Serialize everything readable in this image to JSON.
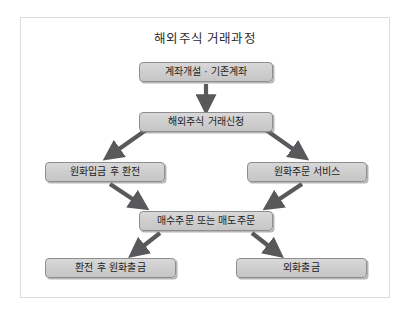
{
  "diagram": {
    "title": "해외주식 거래과정",
    "frame_border_color": "#dcdcdc",
    "node_fill_color": "#d0d0d0",
    "node_border_color": "#8e8e8e",
    "arrow_color": "#59595b",
    "nodes": [
      {
        "id": "account",
        "label": "계좌개설 · 기존계좌"
      },
      {
        "id": "apply",
        "label": "해외주식 거래신청"
      },
      {
        "id": "krw_exchange",
        "label": "원화입금 후 환전"
      },
      {
        "id": "krw_order",
        "label": "원화주문 서비스"
      },
      {
        "id": "buy_sell",
        "label": "매수주문 또는 매도주문"
      },
      {
        "id": "krw_withdraw",
        "label": "환전 후 원화출금"
      },
      {
        "id": "fx_withdraw",
        "label": "외화출금"
      }
    ],
    "edges": [
      {
        "from": "account",
        "to": "apply",
        "direction": "down"
      },
      {
        "from": "apply",
        "to": "krw_exchange",
        "direction": "down-left"
      },
      {
        "from": "apply",
        "to": "krw_order",
        "direction": "down-right"
      },
      {
        "from": "krw_exchange",
        "to": "buy_sell",
        "direction": "down-right"
      },
      {
        "from": "krw_order",
        "to": "buy_sell",
        "direction": "down-left"
      },
      {
        "from": "buy_sell",
        "to": "krw_withdraw",
        "direction": "down-left"
      },
      {
        "from": "buy_sell",
        "to": "fx_withdraw",
        "direction": "down-right"
      }
    ]
  }
}
